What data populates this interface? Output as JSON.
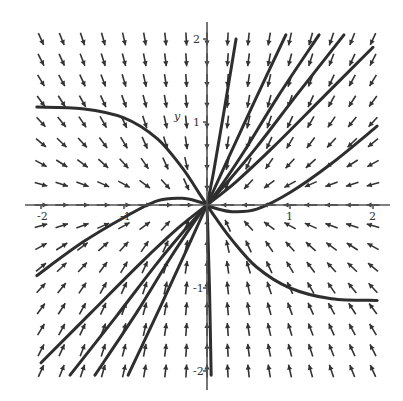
{
  "chart_data": {
    "type": "vector_field",
    "title": "",
    "xlabel": "x",
    "ylabel": "y",
    "xlim": [
      -2.1,
      2.1
    ],
    "ylim": [
      -2.1,
      2.1
    ],
    "x_ticks": [
      -2,
      -1,
      1,
      2
    ],
    "y_ticks": [
      -2,
      -1,
      1,
      2
    ],
    "x_tick_labels": [
      "-2",
      "-1",
      "1",
      "2"
    ],
    "y_tick_labels": [
      "-2",
      "-1",
      "1",
      "2"
    ],
    "grid": false,
    "equilibrium": {
      "x": 0,
      "y": 0,
      "type": "stable node"
    },
    "field_grid": {
      "nx": 17,
      "ny": 17,
      "range": [
        -2,
        2
      ]
    },
    "trajectories": [
      {
        "points": [
          [
            -2.05,
            1.18
          ],
          [
            -1.5,
            1.16
          ],
          [
            -1.0,
            1.05
          ],
          [
            -0.6,
            0.8
          ],
          [
            -0.3,
            0.45
          ],
          [
            -0.1,
            0.15
          ],
          [
            0,
            0
          ]
        ]
      },
      {
        "points": [
          [
            -2.05,
            -0.85
          ],
          [
            -1.5,
            -0.45
          ],
          [
            -1.0,
            -0.15
          ],
          [
            -0.6,
            0.05
          ],
          [
            -0.3,
            0.08
          ],
          [
            -0.1,
            0.04
          ],
          [
            0,
            0
          ]
        ]
      },
      {
        "points": [
          [
            -2.0,
            -1.9
          ],
          [
            -1.4,
            -1.3
          ],
          [
            -0.8,
            -0.7
          ],
          [
            -0.35,
            -0.28
          ],
          [
            0,
            0
          ]
        ]
      },
      {
        "points": [
          [
            -1.65,
            -2.05
          ],
          [
            -1.1,
            -1.35
          ],
          [
            -0.6,
            -0.7
          ],
          [
            -0.25,
            -0.28
          ],
          [
            0,
            0
          ]
        ]
      },
      {
        "points": [
          [
            -1.35,
            -2.05
          ],
          [
            -0.85,
            -1.3
          ],
          [
            -0.45,
            -0.65
          ],
          [
            -0.15,
            -0.2
          ],
          [
            0,
            0
          ]
        ]
      },
      {
        "points": [
          [
            -0.95,
            -2.05
          ],
          [
            -0.55,
            -1.2
          ],
          [
            -0.25,
            -0.55
          ],
          [
            0,
            0
          ]
        ]
      },
      {
        "points": [
          [
            0.05,
            -2.05
          ],
          [
            0.03,
            -1.0
          ],
          [
            0.01,
            -0.3
          ],
          [
            0,
            0
          ]
        ]
      },
      {
        "points": [
          [
            2.05,
            -1.15
          ],
          [
            1.5,
            -1.13
          ],
          [
            1.0,
            -1.0
          ],
          [
            0.6,
            -0.75
          ],
          [
            0.3,
            -0.42
          ],
          [
            0.1,
            -0.15
          ],
          [
            0,
            0
          ]
        ]
      },
      {
        "points": [
          [
            2.05,
            0.95
          ],
          [
            1.5,
            0.5
          ],
          [
            1.0,
            0.15
          ],
          [
            0.6,
            -0.05
          ],
          [
            0.3,
            -0.08
          ],
          [
            0.1,
            -0.04
          ],
          [
            0,
            0
          ]
        ]
      },
      {
        "points": [
          [
            2.0,
            1.9
          ],
          [
            1.4,
            1.3
          ],
          [
            0.8,
            0.7
          ],
          [
            0.35,
            0.28
          ],
          [
            0,
            0
          ]
        ]
      },
      {
        "points": [
          [
            1.65,
            2.05
          ],
          [
            1.1,
            1.35
          ],
          [
            0.6,
            0.7
          ],
          [
            0.25,
            0.28
          ],
          [
            0,
            0
          ]
        ]
      },
      {
        "points": [
          [
            1.35,
            2.05
          ],
          [
            0.85,
            1.3
          ],
          [
            0.45,
            0.65
          ],
          [
            0.15,
            0.2
          ],
          [
            0,
            0
          ]
        ]
      },
      {
        "points": [
          [
            0.95,
            2.05
          ],
          [
            0.55,
            1.2
          ],
          [
            0.25,
            0.55
          ],
          [
            0,
            0
          ]
        ]
      },
      {
        "points": [
          [
            0.35,
            2.0
          ],
          [
            0.2,
            1.1
          ],
          [
            0.08,
            0.4
          ],
          [
            0,
            0
          ]
        ]
      }
    ],
    "annotations": []
  }
}
